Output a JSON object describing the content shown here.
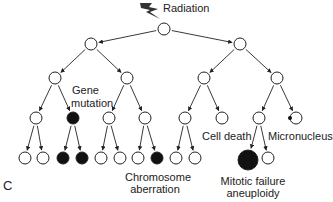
{
  "figure": {
    "panel_label": "C",
    "source_label": "Radiation",
    "source_icon": "lightning-bolt-icon",
    "colors": {
      "stroke": "#222222",
      "fill_affected": "#111111",
      "fill_normal": "#ffffff"
    }
  },
  "labels": {
    "gene_mutation": [
      "Gene",
      "mutation"
    ],
    "chromosome_aberration": [
      "Chromosome",
      "aberration"
    ],
    "cell_death": "Cell death",
    "micronucleus": "Micronucleus",
    "mitotic_failure": [
      "Mitotic failure",
      "aneuploidy"
    ]
  },
  "tree": {
    "description": "Cell lineage tree after radiation exposure",
    "nodes": [
      {
        "id": "root",
        "state": "normal"
      },
      {
        "id": "L1a",
        "parent": "root",
        "state": "normal"
      },
      {
        "id": "L1b",
        "parent": "root",
        "state": "normal"
      },
      {
        "id": "L2a",
        "parent": "L1a",
        "state": "normal"
      },
      {
        "id": "L2b",
        "parent": "L1a",
        "state": "normal"
      },
      {
        "id": "L2c",
        "parent": "L1b",
        "state": "normal"
      },
      {
        "id": "L2d",
        "parent": "L1b",
        "state": "normal"
      },
      {
        "id": "L3a",
        "parent": "L2a",
        "state": "normal"
      },
      {
        "id": "L3b",
        "parent": "L2a",
        "state": "gene-mutation"
      },
      {
        "id": "L3c",
        "parent": "L2b",
        "state": "normal"
      },
      {
        "id": "L3d",
        "parent": "L2b",
        "state": "normal"
      },
      {
        "id": "L3e",
        "parent": "L2c",
        "state": "normal"
      },
      {
        "id": "L3f",
        "parent": "L2c",
        "state": "cell-death"
      },
      {
        "id": "L3g",
        "parent": "L2d",
        "state": "normal"
      },
      {
        "id": "L3h",
        "parent": "L2d",
        "state": "micronucleus"
      },
      {
        "id": "L4a",
        "parent": "L3a",
        "state": "normal"
      },
      {
        "id": "L4b",
        "parent": "L3a",
        "state": "normal"
      },
      {
        "id": "L4c",
        "parent": "L3b",
        "state": "gene-mutation"
      },
      {
        "id": "L4d",
        "parent": "L3b",
        "state": "gene-mutation"
      },
      {
        "id": "L4e",
        "parent": "L3c",
        "state": "normal"
      },
      {
        "id": "L4f",
        "parent": "L3c",
        "state": "normal"
      },
      {
        "id": "L4g",
        "parent": "L3d",
        "state": "normal"
      },
      {
        "id": "L4h",
        "parent": "L3d",
        "state": "chromosome-aberration"
      },
      {
        "id": "L4i",
        "parent": "L3e",
        "state": "normal"
      },
      {
        "id": "L4j",
        "parent": "L3e",
        "state": "normal"
      },
      {
        "id": "L4k",
        "parent": "L3g",
        "state": "mitotic-failure"
      },
      {
        "id": "L4l",
        "parent": "L3g",
        "state": "normal"
      }
    ]
  }
}
